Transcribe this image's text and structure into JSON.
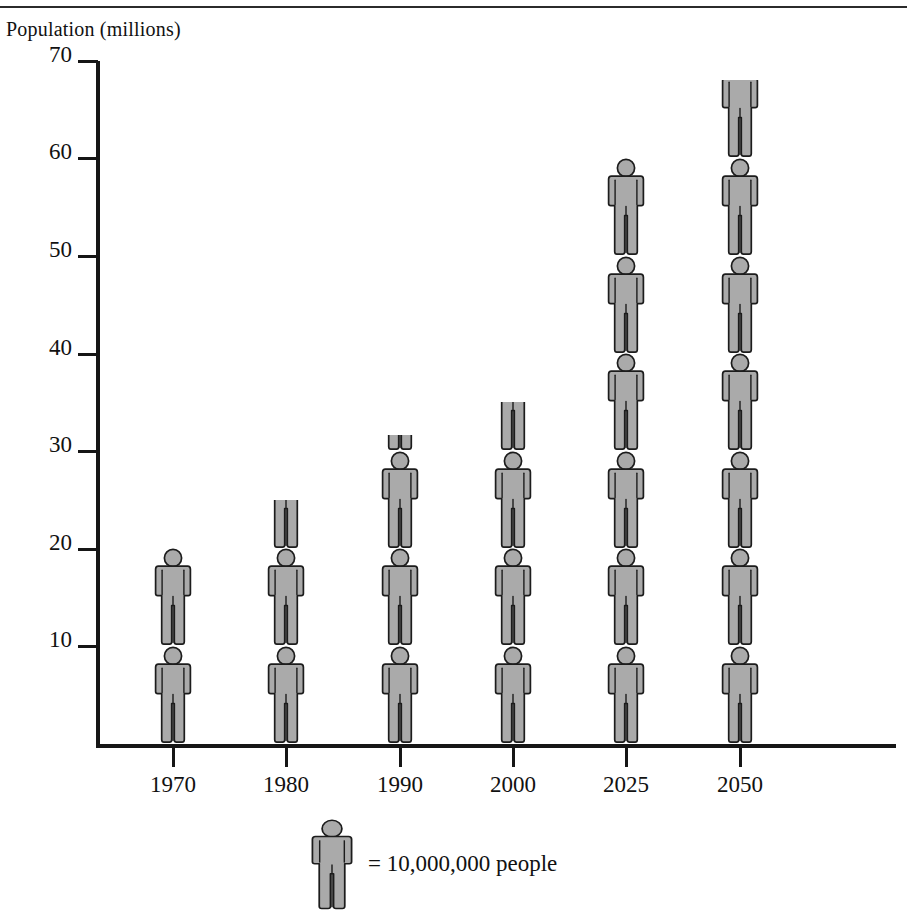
{
  "chart_data": {
    "type": "bar",
    "subtype": "pictograph",
    "title": "",
    "xlabel": "",
    "ylabel": "Population (millions)",
    "categories": [
      "1970",
      "1980",
      "1990",
      "2000",
      "2025",
      "2050"
    ],
    "values": [
      20,
      25,
      31.7,
      35,
      59,
      68
    ],
    "ylim": [
      0,
      70
    ],
    "yticks": [
      10,
      20,
      30,
      40,
      50,
      60,
      70
    ],
    "ytick_labels": [
      "10",
      "20",
      "30",
      "40",
      "50",
      "60",
      "70"
    ],
    "grid": false,
    "legend_position": "below-plot",
    "unit_value": 10,
    "unit_label": "= 10,000,000 people",
    "icon": "person-figure",
    "icon_fill": "#aaaaaa",
    "icon_stroke": "#1c1c1c",
    "axis_color": "#161616",
    "background": "#ffffff",
    "series": [
      {
        "name": "Population",
        "values": [
          20,
          25,
          31.7,
          35,
          59,
          68
        ],
        "icons_full": [
          2,
          2,
          3,
          3,
          6,
          6
        ],
        "icons_fraction": [
          0,
          0.5,
          0.17,
          0.5,
          0,
          0.8
        ]
      }
    ]
  },
  "axis": {
    "y_title": "Population (millions)"
  },
  "legend": {
    "equals_text": "=",
    "value_text": "10,000,000 people",
    "full_text": "= 10,000,000 people"
  }
}
